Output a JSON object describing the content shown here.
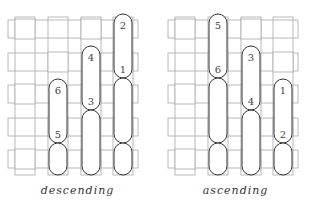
{
  "colors": {
    "grid_stroke": "#a8a8a8",
    "float_stroke": "#333333",
    "label": "#444444",
    "background": "#ffffff"
  },
  "panels": [
    {
      "id": "descending",
      "caption": "descending",
      "offset_x": 0,
      "floats": [
        {
          "col": 3,
          "y1": 14,
          "y2": 78,
          "top_label": "2",
          "bottom_label": "1"
        },
        {
          "col": 2,
          "y1": 46,
          "y2": 110,
          "top_label": "4",
          "bottom_label": "3"
        },
        {
          "col": 1,
          "y1": 79,
          "y2": 143,
          "top_label": "6",
          "bottom_label": "5"
        },
        {
          "col": 3,
          "y1": 78,
          "y2": 143,
          "top_label": "",
          "bottom_label": ""
        },
        {
          "col": 3,
          "y1": 143,
          "y2": 175,
          "top_label": "",
          "bottom_label": ""
        },
        {
          "col": 2,
          "y1": 110,
          "y2": 175,
          "top_label": "",
          "bottom_label": ""
        },
        {
          "col": 1,
          "y1": 143,
          "y2": 175,
          "top_label": "",
          "bottom_label": ""
        }
      ]
    },
    {
      "id": "ascending",
      "caption": "ascending",
      "offset_x": 160,
      "floats": [
        {
          "col": 1,
          "y1": 14,
          "y2": 78,
          "top_label": "5",
          "bottom_label": "6"
        },
        {
          "col": 2,
          "y1": 46,
          "y2": 110,
          "top_label": "3",
          "bottom_label": "4"
        },
        {
          "col": 3,
          "y1": 79,
          "y2": 143,
          "top_label": "1",
          "bottom_label": "2"
        },
        {
          "col": 1,
          "y1": 78,
          "y2": 143,
          "top_label": "",
          "bottom_label": ""
        },
        {
          "col": 1,
          "y1": 143,
          "y2": 175,
          "top_label": "",
          "bottom_label": ""
        },
        {
          "col": 2,
          "y1": 110,
          "y2": 175,
          "top_label": "",
          "bottom_label": ""
        },
        {
          "col": 3,
          "y1": 143,
          "y2": 175,
          "top_label": "",
          "bottom_label": ""
        }
      ]
    }
  ],
  "grid": {
    "columns_x": [
      15,
      48,
      81,
      113
    ],
    "column_width": 20,
    "rows_y": [
      20,
      53,
      85,
      118,
      150
    ],
    "row_height": 18,
    "x_min": 8,
    "x_max": 138,
    "y_top": 14,
    "y_bottom": 175
  }
}
